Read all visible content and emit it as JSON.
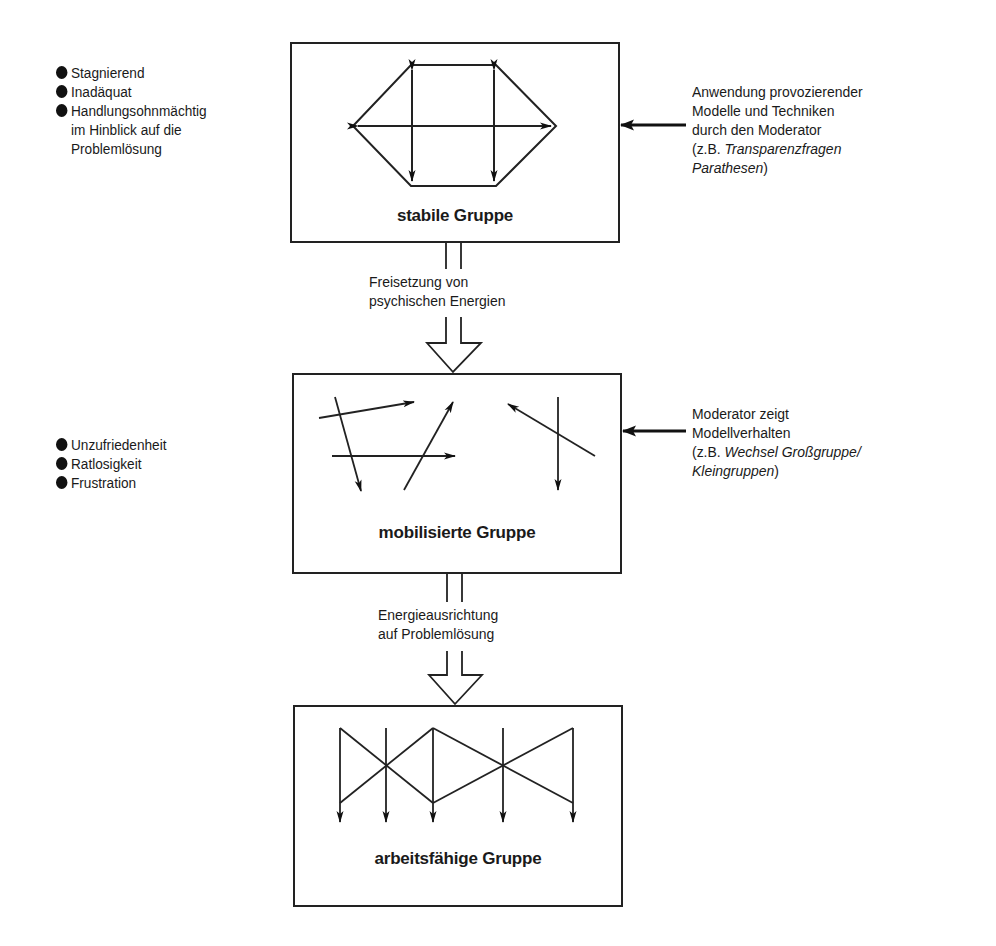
{
  "stages": [
    {
      "title": "stabile Gruppe",
      "left_notes": [
        "Stagnierend",
        "Inadäquat",
        "Handlungsohnmächtig"
      ],
      "left_note_continuation": [
        "im Hinblick auf die",
        "Problemlösung"
      ],
      "right_note": {
        "lines": [
          "Anwendung provozierender",
          "Modelle und Techniken",
          "durch den Moderator"
        ],
        "example_prefix": "(z.B. ",
        "example_italic_1": "Transparenzfragen",
        "example_italic_2": "Parathesen",
        "example_suffix": ")"
      },
      "pattern": "hexagon-with-bidirectional-arrows"
    },
    {
      "title": "mobilisierte Gruppe",
      "left_notes": [
        "Unzufriedenheit",
        "Ratlosigkeit",
        "Frustration"
      ],
      "right_note": {
        "lines": [
          "Moderator zeigt",
          "Modellverhalten"
        ],
        "example_prefix": "(z.B. ",
        "example_italic_1": "Wechsel Großgruppe/",
        "example_italic_2": "Kleingruppen",
        "example_suffix": ")"
      },
      "pattern": "scattered-arrows"
    },
    {
      "title": "arbeitsfähige Gruppe",
      "pattern": "aligned-downward-arrows"
    }
  ],
  "transitions": [
    {
      "from": "stabile Gruppe",
      "to": "mobilisierte Gruppe",
      "lines": [
        "Freisetzung von",
        "psychischen Energien"
      ]
    },
    {
      "from": "mobilisierte Gruppe",
      "to": "arbeitsfähige Gruppe",
      "lines": [
        "Energieausrichtung",
        "auf Problemlösung"
      ]
    }
  ],
  "icons": {
    "bullet": "filled-circle",
    "input_arrow": "left-arrow",
    "transition_arrow": "hollow-down-arrow"
  },
  "colors": {
    "line": "#222222",
    "text": "#1a1a1a",
    "background": "#ffffff"
  }
}
